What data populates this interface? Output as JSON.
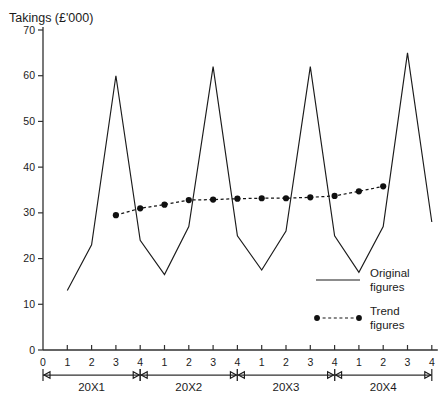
{
  "chart_data": {
    "type": "line",
    "title": "Takings (£'000)",
    "xlabel": "",
    "ylabel": "Takings (£'000)",
    "ylim": [
      0,
      70
    ],
    "ytick_step": 10,
    "yticks": [
      0,
      10,
      20,
      30,
      40,
      50,
      60,
      70
    ],
    "grid": false,
    "legend_position": "right-inside",
    "origin_label": "0",
    "categories": [
      "20X1 Q1",
      "20X1 Q2",
      "20X1 Q3",
      "20X1 Q4",
      "20X2 Q1",
      "20X2 Q2",
      "20X2 Q3",
      "20X2 Q4",
      "20X3 Q1",
      "20X3 Q2",
      "20X3 Q3",
      "20X3 Q4",
      "20X4 Q1",
      "20X4 Q2",
      "20X4 Q3",
      "20X4 Q4"
    ],
    "xtick_labels": [
      "1",
      "2",
      "3",
      "4",
      "1",
      "2",
      "3",
      "4",
      "1",
      "2",
      "3",
      "4",
      "1",
      "2",
      "3",
      "4"
    ],
    "period_groups": [
      {
        "label": "20X1",
        "start_index": 0,
        "end_index": 3
      },
      {
        "label": "20X2",
        "start_index": 4,
        "end_index": 7
      },
      {
        "label": "20X3",
        "start_index": 8,
        "end_index": 11
      },
      {
        "label": "20X4",
        "start_index": 12,
        "end_index": 15
      }
    ],
    "series": [
      {
        "name": "Original figures",
        "style": "solid",
        "markers": false,
        "values": [
          13,
          23,
          60,
          24,
          16.5,
          27,
          62,
          25,
          17.5,
          26,
          62,
          25,
          17,
          27,
          65,
          28
        ]
      },
      {
        "name": "Trend figures",
        "style": "dashed",
        "markers": true,
        "values": [
          null,
          null,
          29.5,
          31,
          31.8,
          32.8,
          32.9,
          33.1,
          33.2,
          33.2,
          33.4,
          33.7,
          34.7,
          35.8,
          null,
          null
        ]
      }
    ]
  },
  "legend": {
    "entries": [
      {
        "label_line1": "Original",
        "label_line2": "figures",
        "style": "solid"
      },
      {
        "label_line1": "Trend",
        "label_line2": "figures",
        "style": "dashed-dots"
      }
    ]
  }
}
